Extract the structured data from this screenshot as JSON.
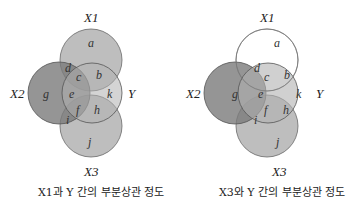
{
  "panels": [
    {
      "variables": {
        "x1": "X1",
        "x2": "X2",
        "y": "Y",
        "x3": "X3"
      },
      "regions": {
        "a": "a",
        "b": "b",
        "c": "c",
        "d": "d",
        "e": "e",
        "f": "f",
        "g": "g",
        "h": "h",
        "i": "i",
        "j": "j",
        "k": "k"
      },
      "highlight": "X1",
      "caption": "X1과 Y 간의 부분상관 정도"
    },
    {
      "variables": {
        "x1": "X1",
        "x2": "X2",
        "y": "Y",
        "x3": "X3"
      },
      "regions": {
        "a": "a",
        "b": "b",
        "c": "c",
        "d": "d",
        "e": "e",
        "f": "f",
        "g": "g",
        "h": "h",
        "i": "i",
        "j": "j",
        "k": "k"
      },
      "highlight": "X3",
      "caption": "X3와 Y 간의 부분상관 정도"
    }
  ],
  "colors": {
    "fill": "#8a8a8a",
    "stroke": "#5a5a5a",
    "empty": "#ffffff"
  }
}
